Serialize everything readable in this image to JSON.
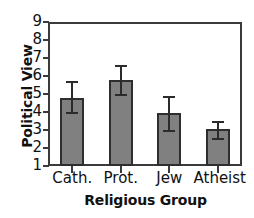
{
  "chart_data": {
    "type": "bar",
    "title": "",
    "xlabel": "Religious Group",
    "ylabel": "Political View",
    "categories": [
      "Cath.",
      "Prot.",
      "Jew",
      "Atheist"
    ],
    "values": [
      4.8,
      5.8,
      3.95,
      3.05
    ],
    "errors_low": [
      4.0,
      5.0,
      3.0,
      2.55
    ],
    "errors_high": [
      5.7,
      6.6,
      4.9,
      3.5
    ],
    "error_bars": true,
    "ylim": [
      1,
      9
    ],
    "yticks": [
      1,
      2,
      3,
      4,
      5,
      6,
      7,
      8,
      9
    ],
    "ytick_labels": [
      "1",
      "2",
      "3",
      "4",
      "5",
      "6",
      "7",
      "8",
      "9"
    ],
    "grid": false,
    "legend": false,
    "bar_color": "#808080",
    "bar_edge_color": "#2e2e2e",
    "axis_color": "#3a3a3a",
    "text_color": "#111111"
  }
}
